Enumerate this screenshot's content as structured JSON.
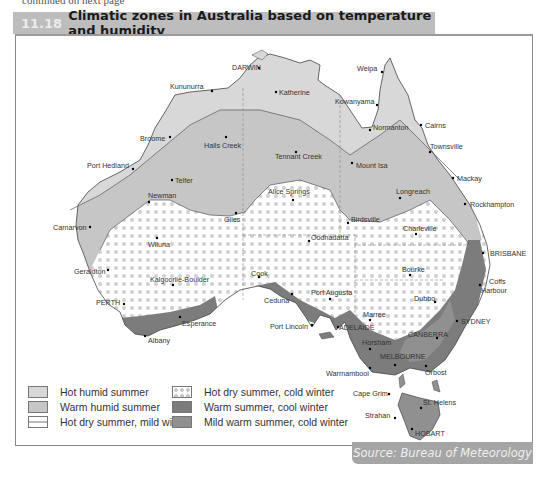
{
  "figure": {
    "number": "11.18",
    "title": "Climatic zones in Australia based on temperature and humidity",
    "top_cropped_text": "continued on next page"
  },
  "colors": {
    "header_bg": "#bdbdbd",
    "hot_humid_summer": "#d8d8d8",
    "warm_humid_summer": "#c6c6c6",
    "hot_dry_summer_cold_winter_dot": "#c8c8c8",
    "warm_summer_cool_winter": "#7c7c7c",
    "mild_warm_summer_cold_winter": "#909090",
    "source_bg": "#a5a5a5"
  },
  "legend": {
    "items": [
      {
        "label": "Hot humid summer",
        "swatch": "hot-humid"
      },
      {
        "label": "Warm humid summer",
        "swatch": "warm-humid"
      },
      {
        "label": "Hot dry summer, mild winter",
        "swatch": "hot-dry-mild"
      },
      {
        "label": "Hot dry summer, cold winter",
        "swatch": "hot-dry-cold"
      },
      {
        "label": "Warm summer, cool winter",
        "swatch": "warm-cool"
      },
      {
        "label": "Mild warm summer, cold winter",
        "swatch": "mild-cold"
      }
    ]
  },
  "places": [
    {
      "name": "DARWIN",
      "x": 257,
      "y": 69
    },
    {
      "name": "Katherine",
      "x": 276,
      "y": 92
    },
    {
      "name": "Kununurra",
      "x": 171,
      "y": 88
    },
    {
      "name": "Weipa",
      "x": 381,
      "y": 69
    },
    {
      "name": "Kowanyama",
      "x": 378,
      "y": 105
    },
    {
      "name": "Normanton",
      "x": 372,
      "y": 128
    },
    {
      "name": "Cairns",
      "x": 421,
      "y": 126
    },
    {
      "name": "Townsville",
      "x": 430,
      "y": 148
    },
    {
      "name": "Broome",
      "x": 143,
      "y": 138
    },
    {
      "name": "Halls Creek",
      "x": 205,
      "y": 146
    },
    {
      "name": "Tennant Creek",
      "x": 285,
      "y": 157
    },
    {
      "name": "Mount Isa",
      "x": 356,
      "y": 165
    },
    {
      "name": "Mackay",
      "x": 453,
      "y": 178
    },
    {
      "name": "Port Hedland",
      "x": 85,
      "y": 165
    },
    {
      "name": "Telfer",
      "x": 179,
      "y": 180
    },
    {
      "name": "Longreach",
      "x": 399,
      "y": 195
    },
    {
      "name": "Rockhampton",
      "x": 470,
      "y": 205
    },
    {
      "name": "Newman",
      "x": 148,
      "y": 195
    },
    {
      "name": "Alice Springs",
      "x": 293,
      "y": 199
    },
    {
      "name": "Giles",
      "x": 236,
      "y": 213
    },
    {
      "name": "Birdsville",
      "x": 348,
      "y": 222
    },
    {
      "name": "Charleville",
      "x": 402,
      "y": 233
    },
    {
      "name": "Carnarvon",
      "x": 55,
      "y": 227
    },
    {
      "name": "Wiluna",
      "x": 157,
      "y": 240
    },
    {
      "name": "Oodnadatta",
      "x": 309,
      "y": 239
    },
    {
      "name": "BRISBANE",
      "x": 488,
      "y": 252
    },
    {
      "name": "Geraldton",
      "x": 74,
      "y": 272
    },
    {
      "name": "Bourke",
      "x": 410,
      "y": 269
    },
    {
      "name": "Coffs Harbour",
      "x": 488,
      "y": 280
    },
    {
      "name": "Kalgoorlie-Boulder",
      "x": 173,
      "y": 282
    },
    {
      "name": "Cook",
      "x": 259,
      "y": 277
    },
    {
      "name": "Dubbo",
      "x": 435,
      "y": 301
    },
    {
      "name": "PERTH",
      "x": 83,
      "y": 302
    },
    {
      "name": "Ceduna",
      "x": 282,
      "y": 299
    },
    {
      "name": "Port Augusta",
      "x": 330,
      "y": 298
    },
    {
      "name": "Esperance",
      "x": 205,
      "y": 324
    },
    {
      "name": "Port Lincoln",
      "x": 313,
      "y": 324
    },
    {
      "name": "Marree",
      "x": 372,
      "y": 320
    },
    {
      "name": "ADELAIDE",
      "x": 361,
      "y": 330
    },
    {
      "name": "SYDNEY",
      "x": 457,
      "y": 321
    },
    {
      "name": "CANBERRA",
      "x": 437,
      "y": 336
    },
    {
      "name": "Horsham",
      "x": 372,
      "y": 342
    },
    {
      "name": "Albany",
      "x": 148,
      "y": 336
    },
    {
      "name": "MELBOURNE",
      "x": 397,
      "y": 358
    },
    {
      "name": "Warrnambool",
      "x": 370,
      "y": 370
    },
    {
      "name": "Orbost",
      "x": 426,
      "y": 371
    },
    {
      "name": "Cape Grim",
      "x": 404,
      "y": 394
    },
    {
      "name": "St. Helens",
      "x": 440,
      "y": 406
    },
    {
      "name": "Strahan",
      "x": 395,
      "y": 418
    },
    {
      "name": "HOBART",
      "x": 431,
      "y": 431
    }
  ],
  "source": {
    "label": "Source: Bureau of Meteorology"
  }
}
